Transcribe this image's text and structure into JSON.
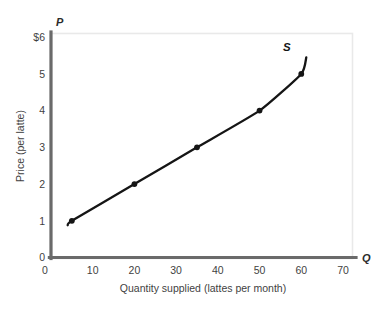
{
  "chart_data": {
    "type": "line",
    "title": "",
    "xlabel": "Quantity supplied (lattes per month)",
    "ylabel": "Price (per latte)",
    "x_axis_symbol": "Q",
    "y_axis_symbol": "P",
    "xlim": [
      0,
      73
    ],
    "ylim": [
      0,
      6.1
    ],
    "grid": false,
    "legend": "none",
    "series": [
      {
        "name": "S",
        "label": "S",
        "label_position": "above-right-end",
        "color": "#151515",
        "x": [
          5,
          20,
          35,
          50,
          60
        ],
        "y": [
          1,
          2,
          3,
          4,
          5
        ],
        "markers": true,
        "curve_start": {
          "x": 4,
          "y": 0.88
        },
        "curve_end": {
          "x": 61.2,
          "y": 5.45
        }
      }
    ],
    "xticks": [
      {
        "value": 0,
        "label": "0"
      },
      {
        "value": 10,
        "label": "10"
      },
      {
        "value": 20,
        "label": "20"
      },
      {
        "value": 30,
        "label": "30"
      },
      {
        "value": 40,
        "label": "40"
      },
      {
        "value": 50,
        "label": "50"
      },
      {
        "value": 60,
        "label": "60"
      },
      {
        "value": 70,
        "label": "70"
      }
    ],
    "yticks": [
      {
        "value": 0,
        "label": "0"
      },
      {
        "value": 1,
        "label": "1"
      },
      {
        "value": 2,
        "label": "2"
      },
      {
        "value": 3,
        "label": "3"
      },
      {
        "value": 4,
        "label": "4"
      },
      {
        "value": 5,
        "label": "5"
      },
      {
        "value": 6,
        "label": "$6"
      }
    ],
    "colors": {
      "axis": "#6a6a6a",
      "frame": "#e8e8e8",
      "curve": "#151515",
      "text": "#3f3f3f",
      "background": "#ffffff"
    }
  }
}
